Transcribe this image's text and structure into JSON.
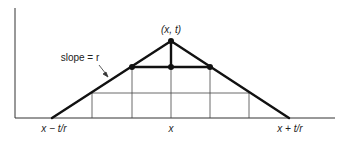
{
  "diagram": {
    "apex_label": "(x, t)",
    "slope_label": "slope = r",
    "x_left_label": "x − t/r",
    "x_center_label": "x",
    "x_right_label": "x + t/r",
    "colors": {
      "line": "#111111",
      "grid": "#444444",
      "background": "#ffffff"
    }
  }
}
